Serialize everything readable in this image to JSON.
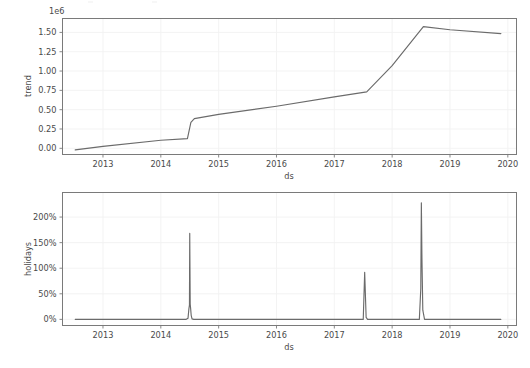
{
  "figure": {
    "background": "#ffffff",
    "line_color": "#6b6b6b",
    "grid_color": "#f2f2f2",
    "spine_color": "#7a7a7a",
    "width": 530,
    "height": 368
  },
  "chart_data": [
    {
      "type": "line",
      "name": "trend-panel",
      "title": "",
      "xlabel": "ds",
      "ylabel": "trend",
      "y_offset_text": "1e6",
      "y_offset_value": 1000000,
      "grid": true,
      "legend": "none",
      "xlim": [
        2012.3,
        2020.15
      ],
      "ylim": [
        -0.08,
        1.68
      ],
      "xticks": [
        2013,
        2014,
        2015,
        2016,
        2017,
        2018,
        2019,
        2020
      ],
      "xticklabels": [
        "2013",
        "2014",
        "2015",
        "2016",
        "2017",
        "2018",
        "2019",
        "2020"
      ],
      "yticks": [
        0.0,
        0.25,
        0.5,
        0.75,
        1.0,
        1.25,
        1.5
      ],
      "yticklabels": [
        "0.00",
        "0.25",
        "0.50",
        "0.75",
        "1.00",
        "1.25",
        "1.50"
      ],
      "x": [
        2012.52,
        2013.0,
        2014.0,
        2014.46,
        2014.52,
        2014.58,
        2015.0,
        2016.0,
        2017.0,
        2017.56,
        2018.0,
        2018.54,
        2019.0,
        2019.88
      ],
      "y": [
        -0.02,
        0.025,
        0.105,
        0.125,
        0.335,
        0.385,
        0.44,
        0.545,
        0.665,
        0.73,
        1.07,
        1.575,
        1.535,
        1.485
      ]
    },
    {
      "type": "line",
      "name": "holidays-panel",
      "title": "",
      "xlabel": "ds",
      "ylabel": "holidays",
      "grid": true,
      "legend": "none",
      "xlim": [
        2012.3,
        2020.15
      ],
      "ylim": [
        -12,
        248
      ],
      "xticks": [
        2013,
        2014,
        2015,
        2016,
        2017,
        2018,
        2019,
        2020
      ],
      "xticklabels": [
        "2013",
        "2014",
        "2015",
        "2016",
        "2017",
        "2018",
        "2019",
        "2020"
      ],
      "yticks": [
        0,
        50,
        100,
        150,
        200
      ],
      "yticklabels": [
        "0%",
        "50%",
        "100%",
        "150%",
        "200%"
      ],
      "x": [
        2012.52,
        2014.44,
        2014.47,
        2014.485,
        2014.495,
        2014.5,
        2014.508,
        2014.515,
        2014.525,
        2014.54,
        2014.57,
        2017.5,
        2017.525,
        2017.55,
        2017.575,
        2018.47,
        2018.495,
        2018.505,
        2018.515,
        2018.53,
        2018.56,
        2019.88
      ],
      "y": [
        0,
        0,
        2,
        20,
        28,
        168,
        30,
        22,
        8,
        1,
        0,
        0,
        92,
        4,
        0,
        0,
        60,
        228,
        120,
        18,
        0,
        0
      ],
      "peaks": [
        {
          "x": 2014.5,
          "value": 168,
          "label": "168%"
        },
        {
          "x": 2017.52,
          "value": 92,
          "label": "92%"
        },
        {
          "x": 2018.5,
          "value": 228,
          "label": "228%"
        }
      ]
    }
  ]
}
